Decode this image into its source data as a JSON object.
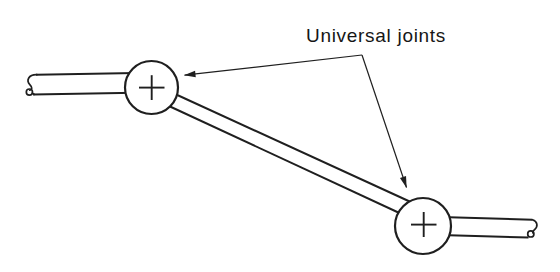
{
  "diagram": {
    "label": "Universal joints",
    "colors": {
      "line": "#1f1f1f",
      "text": "#161616",
      "background": "#ffffff",
      "joint_fill": "#ffffff"
    }
  }
}
